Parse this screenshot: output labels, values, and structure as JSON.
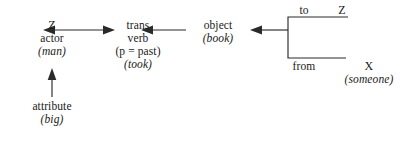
{
  "diagram": {
    "type": "semantic-dependency-diagram",
    "nodes": {
      "actor": {
        "variable": "Z",
        "role": "actor",
        "filler": "(man)"
      },
      "attribute": {
        "role": "attribute",
        "filler": "(big)"
      },
      "verb": {
        "head": "trans",
        "role": "verb",
        "feature": "(p = past)",
        "filler": "(took)"
      },
      "object": {
        "role": "object",
        "filler": "(book)"
      },
      "to": {
        "role": "to",
        "variable": "Z",
        "filler": ""
      },
      "from": {
        "role": "from",
        "variable": "X",
        "filler": "(someone)"
      }
    }
  },
  "colors": {
    "ink": "#2a2a2a",
    "background": "#ffffff"
  },
  "icons": {
    "arrow_left": "arrow-left-icon",
    "arrow_right": "arrow-right-icon",
    "arrow_up": "arrow-up-icon",
    "bracket": "left-bracket-icon"
  }
}
